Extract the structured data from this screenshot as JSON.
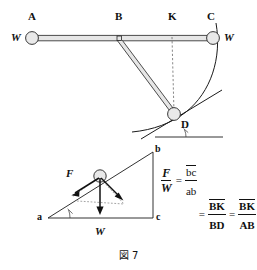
{
  "figure": {
    "caption": "図 7",
    "caption_number": "7"
  },
  "upper_diagram": {
    "name": "pendulum-on-horizontal-rod",
    "points": [
      {
        "id": "A",
        "label": "A",
        "x": 32,
        "y": 38,
        "label_x": 28,
        "label_y": 14,
        "type": "bob-left"
      },
      {
        "id": "B",
        "label": "B",
        "x": 119,
        "y": 38,
        "label_x": 115,
        "label_y": 14,
        "type": "pivot"
      },
      {
        "id": "K",
        "label": "K",
        "x": 172,
        "y": 38,
        "label_x": 167,
        "label_y": 14,
        "type": "tick"
      },
      {
        "id": "C",
        "label": "C",
        "x": 212,
        "y": 38,
        "label_x": 207,
        "label_y": 14,
        "type": "bob-right"
      },
      {
        "id": "D",
        "label": "D",
        "x": 174,
        "y": 115,
        "label_x": 181,
        "label_y": 120,
        "type": "bob-swing"
      }
    ],
    "weight_labels": [
      {
        "id": "W-left",
        "label": "W",
        "x": 12,
        "y": 33
      },
      {
        "id": "W-right",
        "label": "W",
        "x": 226,
        "y": 33
      }
    ]
  },
  "lower_diagram": {
    "name": "force-triangle",
    "vertices": [
      {
        "id": "a",
        "label": "a",
        "x": 48,
        "y": 218,
        "label_x": 38,
        "label_y": 213
      },
      {
        "id": "b",
        "label": "b",
        "x": 153,
        "y": 152,
        "label_x": 155,
        "label_y": 145
      },
      {
        "id": "c",
        "label": "c",
        "x": 153,
        "y": 218,
        "label_x": 156,
        "label_y": 213
      }
    ],
    "vectors": [
      {
        "id": "F",
        "label": "F",
        "label_x": 68,
        "label_y": 170,
        "direction": "up-incline"
      },
      {
        "id": "W",
        "label": "W",
        "label_x": 96,
        "label_y": 229,
        "direction": "down"
      },
      {
        "id": "N",
        "label": "",
        "direction": "down-perpendicular-to-incline"
      }
    ]
  },
  "equations": {
    "line1": {
      "lhs_num": "F",
      "lhs_den": "W",
      "operator": "=",
      "rhs_num": "bc",
      "rhs_den": "ab"
    },
    "line2": {
      "operator1": "=",
      "term1_num": "BK",
      "term1_den": "BD",
      "operator2": "=",
      "term2_num": "BK",
      "term2_den": "AB"
    }
  },
  "colors": {
    "ink": "#1b1b1b",
    "bob_fill": "#e9e9e9",
    "rod_fill": "#e6e6e6",
    "dashed": "#555555",
    "background": "#ffffff"
  }
}
